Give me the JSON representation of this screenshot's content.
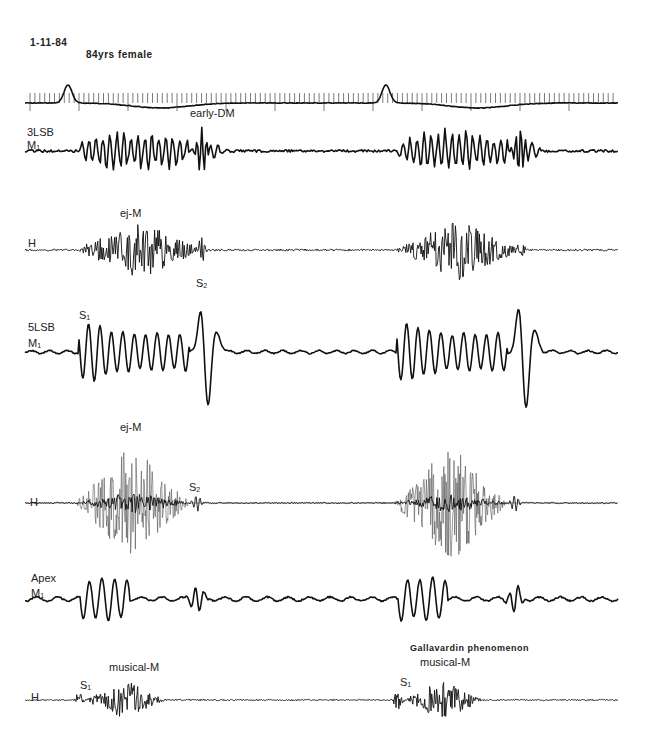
{
  "header": {
    "date": "1-11-84",
    "patient": "84yrs female"
  },
  "annotations": {
    "early_dm": "early-DM",
    "ej_m_1": "ej-M",
    "ej_m_2": "ej-M",
    "s2_a": "S",
    "s2_b": "S",
    "s1_5lsb": "S",
    "musical_m_1": "musical-M",
    "musical_m_2": "musical-M",
    "s1_h_1": "S",
    "s1_h_2": "S",
    "gallavardin": "Gallavardin phenomenon",
    "sub_1": "1",
    "sub_2": "2"
  },
  "channels": [
    {
      "id": "ecg",
      "label": "",
      "lead": "",
      "baseline_y": 103
    },
    {
      "id": "3lsb_m",
      "label": "3LSB",
      "lead": "M",
      "baseline_y": 151
    },
    {
      "id": "3lsb_h",
      "label": "",
      "lead": "H",
      "baseline_y": 250
    },
    {
      "id": "5lsb_m",
      "label": "5LSB",
      "lead": "M",
      "baseline_y": 352
    },
    {
      "id": "5lsb_h",
      "label": "",
      "lead": "H",
      "baseline_y": 503
    },
    {
      "id": "apex_m",
      "label": "Apex",
      "lead": "M",
      "baseline_y": 599
    },
    {
      "id": "apex_h",
      "label": "",
      "lead": "H",
      "baseline_y": 700
    }
  ],
  "beats": [
    {
      "s1_x": 80,
      "s2_x": 202
    },
    {
      "s1_x": 398,
      "s2_x": 520
    }
  ],
  "colors": {
    "trace": "#111111",
    "background": "#ffffff",
    "text": "#222222"
  }
}
